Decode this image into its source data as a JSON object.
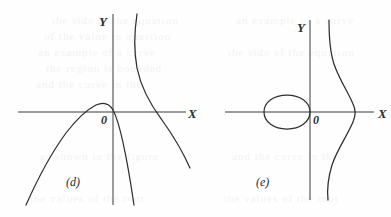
{
  "figure": {
    "caption_style": "textbook-graph-sketch",
    "panels": [
      {
        "id": "d",
        "label": "(d)",
        "axis_x_label": "X",
        "axis_y_label": "Y",
        "origin_label": "0",
        "curves": [
          {
            "name": "left-branch-arch",
            "description": "downward-opening arch peaking just left of the Y-axis, descending to lower left"
          },
          {
            "name": "descending-branch-through-origin",
            "description": "steep branch falling from the arch peak through the origin down to lower right"
          },
          {
            "name": "right-hyperbola-branch",
            "description": "branch descending from top, crossing the X-axis and continuing to lower right"
          }
        ]
      },
      {
        "id": "e",
        "label": "(e)",
        "axis_x_label": "X",
        "axis_y_label": "Y",
        "origin_label": "0",
        "curves": [
          {
            "name": "closed-oval-loop",
            "description": "small closed oval left of the origin, tangent to the Y-axis, centered on the X-axis"
          },
          {
            "name": "s-shaped-branch",
            "description": "S-shaped curve right of the Y-axis crossing the X-axis, bulging right at the crossing"
          }
        ]
      }
    ]
  },
  "bleed_text": {
    "lines": [
      "the side of the equation",
      "of the value in question",
      "an example of a curve",
      "the region is bounded",
      "and the curve in the",
      "as shown in the figure",
      "the values of the root"
    ]
  }
}
